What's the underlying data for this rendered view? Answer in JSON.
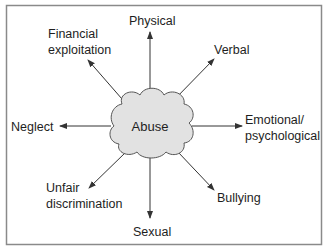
{
  "diagram": {
    "center": {
      "label": "Abuse",
      "fill": "#e2e2e2",
      "stroke": "#555555"
    },
    "branches": [
      {
        "id": "physical",
        "lines": [
          "Physical"
        ]
      },
      {
        "id": "verbal",
        "lines": [
          "Verbal"
        ]
      },
      {
        "id": "emotional",
        "lines": [
          "Emotional/",
          "psychological"
        ]
      },
      {
        "id": "bullying",
        "lines": [
          "Bullying"
        ]
      },
      {
        "id": "sexual",
        "lines": [
          "Sexual"
        ]
      },
      {
        "id": "discrimination",
        "lines": [
          "Unfair",
          "discrimination"
        ]
      },
      {
        "id": "neglect",
        "lines": [
          "Neglect"
        ]
      },
      {
        "id": "financial",
        "lines": [
          "Financial",
          "exploitation"
        ]
      }
    ],
    "frame_color": "#8a8a8a",
    "arrow_color": "#333333"
  }
}
